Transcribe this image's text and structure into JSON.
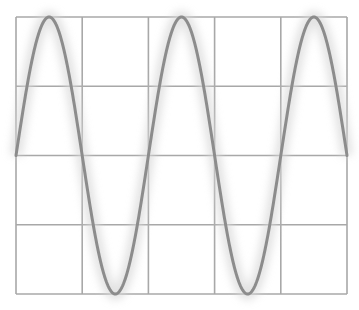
{
  "figure": {
    "width": 359,
    "height": 310,
    "background": "#ffffff",
    "grid": {
      "left": 16,
      "top": 17,
      "right": 347,
      "bottom": 294,
      "columns": 5,
      "rows": 4,
      "color": "#a8a8a8",
      "stroke_width": 1.6
    },
    "wave": {
      "type": "sine",
      "cycles": 2.5,
      "start_phase": "zero-crossing-rising",
      "baseline_y": 156,
      "amplitude_px": 139,
      "color": "#8c8c8c",
      "stroke_width": 3,
      "glow_color": "#d6d6d6"
    }
  },
  "chart_data": {
    "type": "line",
    "title": "",
    "xlabel": "",
    "ylabel": "",
    "series": [
      {
        "name": "sine wave",
        "function": "sin(x)",
        "cycles": 2.5,
        "x": [
          0,
          0.25,
          0.5,
          0.75,
          1.0,
          1.25,
          1.5,
          1.75,
          2.0,
          2.25,
          2.5
        ],
        "values": [
          0,
          1,
          0,
          -1,
          0,
          1,
          0,
          -1,
          0,
          1,
          0
        ]
      }
    ],
    "xlim": [
      0,
      2.5
    ],
    "ylim": [
      -1,
      1
    ],
    "grid": true,
    "grid_divisions": {
      "x": 5,
      "y": 4
    },
    "legend": false
  }
}
